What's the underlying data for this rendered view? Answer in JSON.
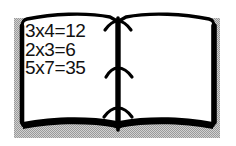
{
  "image": {
    "subject": "open-book-clipart",
    "description": "Black and white clip art of an open book with handwritten multiplication facts on the left page",
    "width": 236,
    "height": 146,
    "background_color": "#ffffff"
  },
  "book": {
    "ink_color": "#000000",
    "page_color": "#ffffff",
    "shadow_color": "#9a9a9a",
    "left_page": {
      "label": "left-page",
      "lines": [
        "3x4=12",
        "2x3=6",
        "5x7=35"
      ]
    },
    "right_page": {
      "label": "right-page",
      "lines": []
    },
    "spine": {
      "label": "spine",
      "stitch_count": 3
    }
  }
}
